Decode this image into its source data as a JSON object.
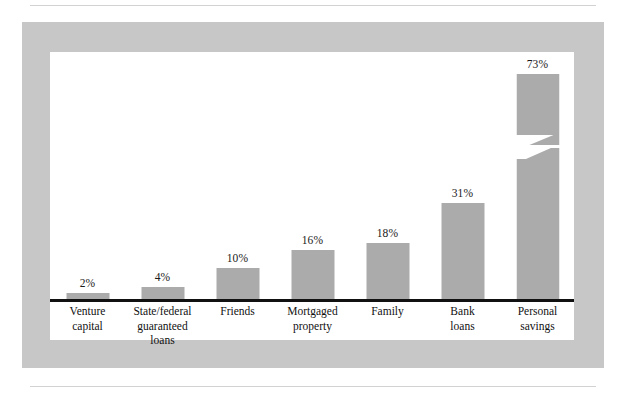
{
  "figure": {
    "panel_color": "#c7c7c7",
    "plot_background": "#ffffff",
    "bar_color": "#ababab",
    "axis_color": "#111111",
    "rule_color": "#d2d2d2"
  },
  "chart_data": {
    "type": "bar",
    "title": "",
    "subtitle": "",
    "xlabel": "",
    "ylabel": "",
    "grid": false,
    "legend": null,
    "ylim": [
      0,
      80
    ],
    "value_suffix": "%",
    "note": "Final bar is drawn with a zig-zag axis break indicating a truncated/compressed scale.",
    "categories": [
      "Venture capital",
      "State/federal guaranteed loans",
      "Friends",
      "Mortgaged property",
      "Family",
      "Bank loans",
      "Personal savings"
    ],
    "values": [
      2,
      4,
      10,
      16,
      18,
      31,
      73
    ],
    "data_labels": [
      "2%",
      "4%",
      "10%",
      "16%",
      "18%",
      "31%",
      "73%"
    ],
    "tick_labels": [
      [
        "Venture",
        "capital"
      ],
      [
        "State/federal",
        "guaranteed",
        "loans"
      ],
      [
        "Friends"
      ],
      [
        "Mortgaged",
        "property"
      ],
      [
        "Family"
      ],
      [
        "Bank",
        "loans"
      ],
      [
        "Personal",
        "savings"
      ]
    ],
    "bars": [
      {
        "label": "Venture capital",
        "value": 2,
        "data_label": "2%",
        "broken": false
      },
      {
        "label": "State/federal guaranteed loans",
        "value": 4,
        "data_label": "4%",
        "broken": false
      },
      {
        "label": "Friends",
        "value": 10,
        "data_label": "10%",
        "broken": false
      },
      {
        "label": "Mortgaged property",
        "value": 16,
        "data_label": "16%",
        "broken": false
      },
      {
        "label": "Family",
        "value": 18,
        "data_label": "18%",
        "broken": false
      },
      {
        "label": "Bank loans",
        "value": 31,
        "data_label": "31%",
        "broken": false
      },
      {
        "label": "Personal savings",
        "value": 73,
        "data_label": "73%",
        "broken": true
      }
    ]
  }
}
